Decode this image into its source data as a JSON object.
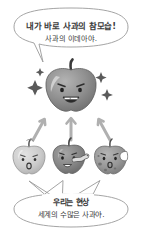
{
  "illustration": {
    "title": "plato-theory-of-forms-apple-cartoon",
    "background_color": "#ffffff",
    "outline_color": "#8a8a8a",
    "text_color": "#3a3a3a"
  },
  "top_bubble": {
    "line_1": "내가 바로 사과의 참모습!",
    "line_2": "사과의 이데아야.",
    "tail_direction": "down-right",
    "border_color": "#9a9a9a",
    "fill_color": "#ffffff"
  },
  "bottom_bubble": {
    "line_1": "우리는 현상",
    "line_2": "세계의 수많은 사과야.",
    "tail_count": 3,
    "tail_direction": "up",
    "border_color": "#9a9a9a",
    "fill_color": "#ffffff"
  },
  "ideal_apple": {
    "label": "ideal-apple",
    "body_color": "#8f8f8f",
    "shade_color": "#7a7a7a",
    "highlight_color": "#c9c9c9",
    "stem_color": "#3a3a3a",
    "expression": "confident-grin",
    "mouth": "open-smile-with-teeth",
    "eyebrows": "angled-determined",
    "sparkle_count": 4,
    "sparkle_color": "#5a5a5a"
  },
  "real_apples": [
    {
      "label": "pale-surprised-apple",
      "body_color": "#cfcfcf",
      "shade_color": "#b5b5b5",
      "expression": "surprised",
      "mouth": "open-oval",
      "feature": "plain"
    },
    {
      "label": "wormy-apple",
      "body_color": "#8a8a8a",
      "shade_color": "#6f6f6f",
      "expression": "uneasy-wavy",
      "mouth": "wavy-open",
      "feature": "worm-emerging",
      "worm_color": "#d8d8d8"
    },
    {
      "label": "bitten-bruised-apple",
      "body_color": "#9b9b9b",
      "shade_color": "#7f7f7f",
      "expression": "worried",
      "mouth": "open-oval",
      "feature": "bite-mark-and-spots",
      "spot_color": "#6a6a6a"
    }
  ],
  "arrows": {
    "count": 3,
    "direction": "upward",
    "color": "#b0b0b0",
    "targets": "ideal-apple",
    "sources": [
      "pale-surprised-apple",
      "wormy-apple",
      "bitten-bruised-apple"
    ]
  }
}
